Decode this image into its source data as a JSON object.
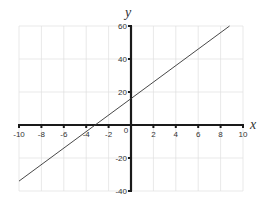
{
  "chart_data": {
    "type": "line",
    "title": "",
    "xlabel": "x",
    "ylabel": "y",
    "xlim": [
      -10,
      10
    ],
    "ylim": [
      -40,
      60
    ],
    "grid": true,
    "legend": null,
    "x_ticks": [
      -10,
      -8,
      -6,
      -4,
      -2,
      0,
      2,
      4,
      6,
      8,
      10
    ],
    "x_tick_labels": [
      "-10",
      "-8",
      "-6",
      "-4",
      "-2",
      "0",
      "2",
      "4",
      "6",
      "8",
      "10"
    ],
    "y_ticks": [
      -40,
      -20,
      20,
      40,
      60
    ],
    "y_tick_labels": [
      "-40",
      "-20",
      "20",
      "40",
      "60"
    ],
    "series": [
      {
        "name": "line",
        "equation": "y = 5x + 16",
        "x": [
          -10,
          8.8
        ],
        "y": [
          -34,
          60
        ],
        "color": "#333333"
      }
    ],
    "annotations": {
      "y_intercept": 16,
      "x_intercept": -3.2
    }
  },
  "colors": {
    "axis": "#1a1a1a",
    "grid": "#e0e0e0",
    "line": "#333333",
    "text": "#333333"
  }
}
